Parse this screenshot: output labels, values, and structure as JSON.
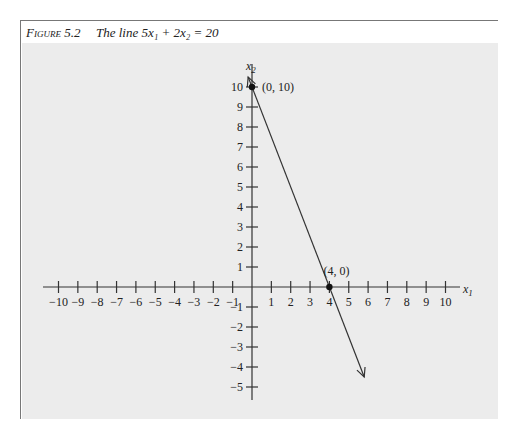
{
  "caption": {
    "figure_label": "Figure 5.2",
    "title": "The line 5x₁ + 2x₂ = 20"
  },
  "chart_data": {
    "type": "line",
    "equation": "5x1 + 2x2 = 20",
    "xlabel": "x1",
    "ylabel": "x2",
    "xlim": [
      -10,
      10
    ],
    "ylim": [
      -5,
      10
    ],
    "x_ticks": [
      -10,
      -9,
      -8,
      -7,
      -6,
      -5,
      -4,
      -3,
      -2,
      -1,
      1,
      2,
      3,
      4,
      5,
      6,
      7,
      8,
      9,
      10
    ],
    "y_ticks": [
      -5,
      -4,
      -3,
      -2,
      -1,
      1,
      2,
      3,
      4,
      5,
      6,
      7,
      8,
      9,
      10
    ],
    "grid": false,
    "series": [
      {
        "name": "5x1 + 2x2 = 20",
        "x": [
          -0.2,
          5.8
        ],
        "y": [
          10.5,
          -4.5
        ],
        "arrows": "both"
      }
    ],
    "points": [
      {
        "label": "(0, 10)",
        "x": 0,
        "y": 10
      },
      {
        "label": "(4, 0)",
        "x": 4,
        "y": 0
      }
    ]
  }
}
